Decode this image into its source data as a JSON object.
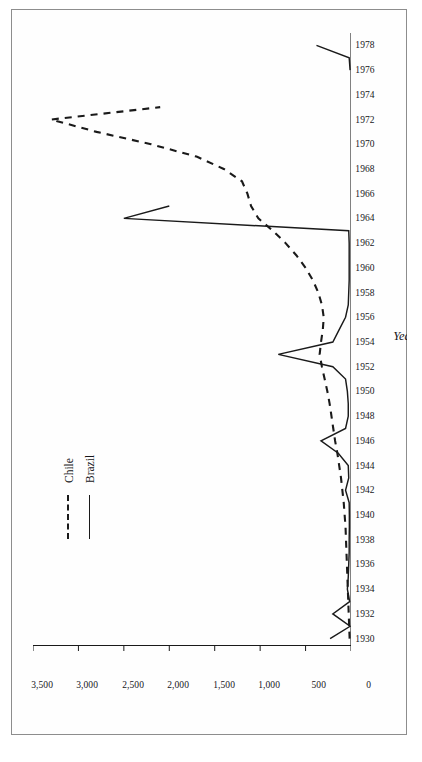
{
  "figure": {
    "axis_titles": {
      "x": "Year",
      "y": "Number"
    },
    "legend": [
      {
        "name": "Chile",
        "style": "dashed"
      },
      {
        "name": "Brazil",
        "style": "solid"
      }
    ],
    "colors": {
      "ink": "#1a1a1a",
      "frame": "#8d8d8d",
      "paper": "#ffffff"
    }
  },
  "chart_data": {
    "type": "line",
    "title": "",
    "xlabel": "Year",
    "ylabel": "Number",
    "xlim": [
      1929,
      1979
    ],
    "ylim": [
      0,
      3500
    ],
    "yticks": [
      0,
      500,
      1000,
      1500,
      2000,
      2500,
      3000,
      3500
    ],
    "ytick_labels": [
      "0",
      "500",
      "1,000",
      "1,500",
      "2,000",
      "2,500",
      "3,000",
      "3,500"
    ],
    "xticks": [
      1930,
      1932,
      1934,
      1936,
      1938,
      1940,
      1942,
      1944,
      1946,
      1948,
      1950,
      1952,
      1954,
      1956,
      1958,
      1960,
      1962,
      1964,
      1966,
      1968,
      1970,
      1972,
      1974,
      1976,
      1978
    ],
    "xtick_labels": [
      "1930",
      "1932",
      "1934",
      "1936",
      "1938",
      "1940",
      "1942",
      "1944",
      "1946",
      "1948",
      "1950",
      "1952",
      "1954",
      "1956",
      "1958",
      "1960",
      "1962",
      "1964",
      "1966",
      "1968",
      "1970",
      "1972",
      "1974",
      "1976",
      "1978"
    ],
    "minor_xtick_interval": 1,
    "grid": false,
    "legend_position": "upper-left-inside",
    "series": [
      {
        "name": "Chile",
        "style": "dashed",
        "x": [
          1930,
          1931,
          1932,
          1933,
          1934,
          1935,
          1936,
          1937,
          1938,
          1939,
          1940,
          1941,
          1942,
          1943,
          1944,
          1945,
          1946,
          1947,
          1948,
          1949,
          1950,
          1951,
          1952,
          1953,
          1954,
          1955,
          1956,
          1957,
          1958,
          1959,
          1960,
          1961,
          1962,
          1963,
          1964,
          1965,
          1966,
          1967,
          1968,
          1969,
          1970,
          1971,
          1972,
          1973
        ],
        "values": [
          15,
          20,
          25,
          30,
          35,
          40,
          45,
          50,
          55,
          60,
          70,
          80,
          95,
          110,
          130,
          150,
          175,
          195,
          215,
          235,
          260,
          290,
          320,
          345,
          330,
          310,
          300,
          320,
          360,
          420,
          500,
          600,
          720,
          860,
          1020,
          1100,
          1140,
          1200,
          1400,
          1700,
          2200,
          2800,
          3300,
          2100
        ]
      },
      {
        "name": "Brazil",
        "style": "solid",
        "x": [
          1930,
          1931,
          1932,
          1933,
          1934,
          1935,
          1936,
          1937,
          1938,
          1939,
          1940,
          1941,
          1942,
          1943,
          1944,
          1945,
          1946,
          1947,
          1948,
          1949,
          1950,
          1951,
          1952,
          1953,
          1954,
          1955,
          1956,
          1957,
          1958,
          1959,
          1960,
          1961,
          1962,
          1963,
          1964,
          1965,
          1976,
          1977,
          1978
        ],
        "values": [
          230,
          10,
          200,
          15,
          40,
          30,
          25,
          20,
          20,
          18,
          18,
          20,
          60,
          25,
          30,
          140,
          330,
          60,
          30,
          30,
          40,
          60,
          200,
          800,
          200,
          130,
          60,
          30,
          25,
          20,
          20,
          20,
          20,
          25,
          2500,
          2000,
          10,
          20,
          380
        ]
      }
    ]
  }
}
